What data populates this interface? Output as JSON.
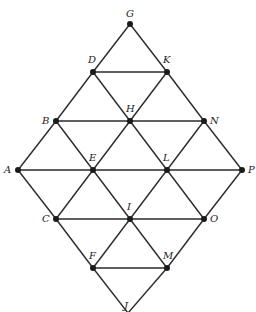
{
  "diagram": {
    "type": "triangular-lattice-rhombus",
    "nodes": [
      {
        "id": "G",
        "x": 130,
        "y": 24,
        "lx": 126,
        "ly": 17
      },
      {
        "id": "D",
        "x": 93,
        "y": 72,
        "lx": 88,
        "ly": 63
      },
      {
        "id": "K",
        "x": 167,
        "y": 72,
        "lx": 163,
        "ly": 63
      },
      {
        "id": "B",
        "x": 56,
        "y": 121,
        "lx": 42,
        "ly": 124
      },
      {
        "id": "H",
        "x": 130,
        "y": 121,
        "lx": 126,
        "ly": 112
      },
      {
        "id": "N",
        "x": 204,
        "y": 121,
        "lx": 210,
        "ly": 124
      },
      {
        "id": "A",
        "x": 18,
        "y": 170,
        "lx": 4,
        "ly": 173
      },
      {
        "id": "E",
        "x": 93,
        "y": 170,
        "lx": 89,
        "ly": 161
      },
      {
        "id": "L",
        "x": 167,
        "y": 170,
        "lx": 163,
        "ly": 161
      },
      {
        "id": "P",
        "x": 242,
        "y": 170,
        "lx": 248,
        "ly": 173
      },
      {
        "id": "C",
        "x": 56,
        "y": 219,
        "lx": 42,
        "ly": 222
      },
      {
        "id": "I",
        "x": 130,
        "y": 219,
        "lx": 127,
        "ly": 210
      },
      {
        "id": "O",
        "x": 204,
        "y": 219,
        "lx": 210,
        "ly": 222
      },
      {
        "id": "F",
        "x": 93,
        "y": 268,
        "lx": 89,
        "ly": 259
      },
      {
        "id": "M",
        "x": 167,
        "y": 268,
        "lx": 163,
        "ly": 259
      },
      {
        "id": "J",
        "x": 128,
        "y": 313,
        "lx": 124,
        "ly": 309,
        "dot": false
      }
    ],
    "edges": [
      [
        "D",
        "K"
      ],
      [
        "B",
        "H"
      ],
      [
        "H",
        "N"
      ],
      [
        "A",
        "E"
      ],
      [
        "E",
        "L"
      ],
      [
        "L",
        "P"
      ],
      [
        "C",
        "I"
      ],
      [
        "I",
        "O"
      ],
      [
        "F",
        "M"
      ],
      [
        "G",
        "D"
      ],
      [
        "D",
        "B"
      ],
      [
        "B",
        "A"
      ],
      [
        "K",
        "H"
      ],
      [
        "H",
        "E"
      ],
      [
        "E",
        "C"
      ],
      [
        "N",
        "L"
      ],
      [
        "L",
        "I"
      ],
      [
        "I",
        "F"
      ],
      [
        "P",
        "O"
      ],
      [
        "O",
        "M"
      ],
      [
        "M",
        "J"
      ],
      [
        "G",
        "K"
      ],
      [
        "K",
        "N"
      ],
      [
        "N",
        "P"
      ],
      [
        "D",
        "H"
      ],
      [
        "H",
        "L"
      ],
      [
        "L",
        "O"
      ],
      [
        "B",
        "E"
      ],
      [
        "E",
        "I"
      ],
      [
        "I",
        "M"
      ],
      [
        "A",
        "C"
      ],
      [
        "C",
        "F"
      ],
      [
        "F",
        "J"
      ]
    ],
    "colors": {
      "line": "#2a2a2a",
      "node": "#1a1a1a",
      "label": "#222222"
    }
  }
}
